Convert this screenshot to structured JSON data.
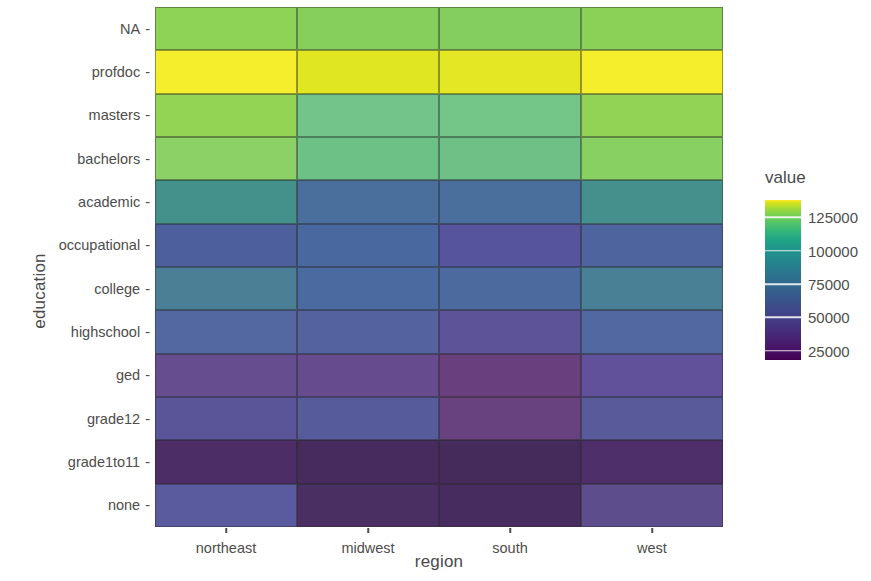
{
  "chart_data": {
    "type": "heatmap",
    "title": "",
    "xlabel": "region",
    "ylabel": "education",
    "legend_title": "value",
    "legend_position": "right",
    "colormap": "viridis",
    "grid": false,
    "x_categories": [
      "northeast",
      "midwest",
      "south",
      "west"
    ],
    "y_categories": [
      "none",
      "grade1to11",
      "grade12",
      "ged",
      "highschool",
      "college",
      "occupational",
      "academic",
      "bachelors",
      "masters",
      "profdoc",
      "NA"
    ],
    "y_categories_top_to_bottom": [
      "NA",
      "profdoc",
      "masters",
      "bachelors",
      "academic",
      "occupational",
      "college",
      "highschool",
      "ged",
      "grade12",
      "grade1to11",
      "none"
    ],
    "legend_ticks": [
      25000,
      50000,
      75000,
      100000,
      125000
    ],
    "zlim": [
      18000,
      138000
    ],
    "rows": [
      {
        "education": "NA",
        "values": {
          "northeast": 118000,
          "midwest": 116000,
          "south": 114000,
          "west": 117000
        },
        "colors": [
          "#8ed256",
          "#87cf5c",
          "#84ce60",
          "#8bd158"
        ]
      },
      {
        "education": "profdoc",
        "values": {
          "northeast": 138000,
          "midwest": 131000,
          "south": 132000,
          "west": 138000
        },
        "colors": [
          "#f5ee2c",
          "#e1e622",
          "#e4e723",
          "#f5ee2c"
        ]
      },
      {
        "education": "masters",
        "values": {
          "northeast": 120000,
          "midwest": 106000,
          "south": 107000,
          "west": 119000
        },
        "colors": [
          "#93d455",
          "#72c48a",
          "#74c588",
          "#92d356"
        ]
      },
      {
        "education": "bachelors",
        "values": {
          "northeast": 113000,
          "midwest": 100000,
          "south": 100000,
          "west": 111000
        },
        "colors": [
          "#8bd165",
          "#6dc186",
          "#6ec086",
          "#89d063"
        ]
      },
      {
        "education": "academic",
        "values": {
          "northeast": 82000,
          "midwest": 64000,
          "south": 64000,
          "west": 80000
        },
        "colors": [
          "#44918c",
          "#4a6f9c",
          "#4a6f9c",
          "#45908d"
        ]
      },
      {
        "education": "occupational",
        "values": {
          "northeast": 63000,
          "midwest": 57000,
          "south": 52000,
          "west": 61000
        },
        "colors": [
          "#4d5f9d",
          "#4a68a0",
          "#56549c",
          "#4e649e"
        ]
      },
      {
        "education": "college",
        "values": {
          "northeast": 70000,
          "midwest": 61000,
          "south": 60000,
          "west": 70000
        },
        "colors": [
          "#4a7f96",
          "#4b6aa0",
          "#4c6a9e",
          "#4a8095"
        ]
      },
      {
        "education": "highschool",
        "values": {
          "northeast": 57000,
          "midwest": 54000,
          "south": 47000,
          "west": 57000
        },
        "colors": [
          "#5367a0",
          "#5463a0",
          "#5c5398",
          "#5268a1"
        ]
      },
      {
        "education": "ged",
        "values": {
          "northeast": 43000,
          "midwest": 42000,
          "south": 36000,
          "west": 45000
        },
        "colors": [
          "#654d90",
          "#664c8e",
          "#6a3f7e",
          "#61519a"
        ]
      },
      {
        "education": "grade12",
        "values": {
          "northeast": 42000,
          "midwest": 45000,
          "south": 35000,
          "west": 44000
        },
        "colors": [
          "#5a5598",
          "#565b9c",
          "#68427f",
          "#585a9a"
        ]
      },
      {
        "education": "grade1to11",
        "values": {
          "northeast": 30000,
          "midwest": 28000,
          "south": 26000,
          "west": 31000
        },
        "colors": [
          "#4d2d66",
          "#472a5e",
          "#452a5c",
          "#4f2f69"
        ]
      },
      {
        "education": "none",
        "values": {
          "northeast": 42000,
          "midwest": 25000,
          "south": 24000,
          "west": 38000
        },
        "colors": [
          "#5a5a9e",
          "#4a2f63",
          "#472c60",
          "#5d4d8d"
        ]
      }
    ]
  },
  "axes": {
    "y_title": "education",
    "x_title": "region"
  },
  "legend": {
    "title": "value",
    "labels": [
      "125000",
      "100000",
      "75000",
      "50000",
      "25000"
    ]
  }
}
